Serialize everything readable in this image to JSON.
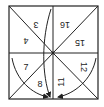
{
  "diagram": {
    "stroke_color": "#222222",
    "background": "#ffffff",
    "regions": [
      {
        "id": "r3",
        "label": "3",
        "quadrant": "top-left",
        "rotated": true
      },
      {
        "id": "r4",
        "label": "4",
        "quadrant": "top-left",
        "rotated": true
      },
      {
        "id": "r16",
        "label": "16",
        "quadrant": "top-right",
        "rotated": true
      },
      {
        "id": "r15",
        "label": "15",
        "quadrant": "top-right",
        "rotated": true
      },
      {
        "id": "r7",
        "label": "7",
        "quadrant": "bottom-left",
        "rotated": false
      },
      {
        "id": "r8",
        "label": "8",
        "quadrant": "bottom-left",
        "rotated": false
      },
      {
        "id": "r12",
        "label": "12",
        "quadrant": "bottom-right",
        "rotated": true
      },
      {
        "id": "r11",
        "label": "11",
        "quadrant": "bottom-right",
        "rotated": true
      }
    ],
    "arrows": [
      {
        "id": "arrow-top",
        "from": "top-center",
        "to": "bottom-center"
      },
      {
        "id": "arrow-left",
        "from": "left-mid",
        "to": "bottom-center"
      },
      {
        "id": "arrow-right",
        "from": "right-mid",
        "to": "bottom-center"
      }
    ]
  }
}
